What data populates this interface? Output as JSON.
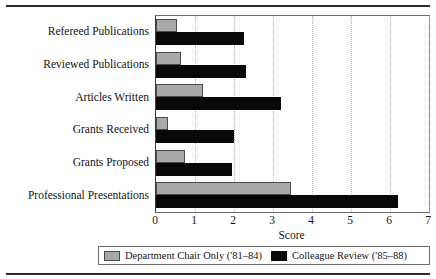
{
  "chart_data": {
    "type": "bar",
    "orientation": "horizontal",
    "title": "",
    "xlabel": "Score",
    "ylabel": "",
    "xlim": [
      0,
      7
    ],
    "xticks": [
      0,
      1,
      2,
      3,
      4,
      5,
      6,
      7
    ],
    "xtick_labels": [
      "0",
      "1",
      "2",
      "3",
      "4",
      "5",
      "6",
      "7"
    ],
    "grid": "vertical-dotted",
    "legend_position": "bottom",
    "categories": [
      "Refereed Publications",
      "Reviewed Publications",
      "Articles Written",
      "Grants Received",
      "Grants Proposed",
      "Professional Presentations"
    ],
    "series": [
      {
        "name": "Department Chair Only ('81–84)",
        "color": "#a9a9a9",
        "values": [
          0.55,
          0.65,
          1.2,
          0.3,
          0.75,
          3.45
        ]
      },
      {
        "name": "Colleague Review ('85–88)",
        "color": "#090909",
        "values": [
          2.25,
          2.3,
          3.2,
          2.0,
          1.95,
          6.2
        ]
      }
    ]
  },
  "legend": {
    "entries": [
      {
        "label": "Department Chair Only ('81–84)",
        "swatch": "gray"
      },
      {
        "label": "Colleague Review ('85–88)",
        "swatch": "black"
      }
    ]
  }
}
